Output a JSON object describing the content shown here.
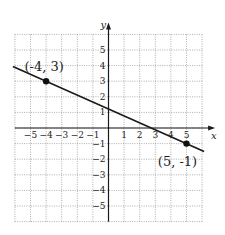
{
  "chart_data": {
    "type": "line",
    "title": "",
    "xlabel": "x",
    "ylabel": "y",
    "xlim": [
      -6,
      6
    ],
    "ylim": [
      -6,
      6
    ],
    "grid": true,
    "grid_style": "dotted",
    "x_ticks": [
      -5,
      -4,
      -3,
      -2,
      -1,
      1,
      2,
      3,
      4,
      5
    ],
    "y_ticks": [
      5,
      4,
      3,
      2,
      1,
      -1,
      -2,
      -3,
      -4,
      -5
    ],
    "x_tick_labels": [
      "−5",
      "−4",
      "−3",
      "−2",
      "−1",
      "1",
      "2",
      "3",
      "4",
      "5"
    ],
    "y_tick_labels": [
      "5",
      "4",
      "3",
      "2",
      "1",
      "−1",
      "−2",
      "−3",
      "−4",
      "−5"
    ],
    "series": [
      {
        "name": "line",
        "color": "#1a1a1a",
        "x": [
          -6,
          6
        ],
        "y": [
          3.889,
          -1.444
        ],
        "slope": -0.444,
        "intercept": 1.222
      }
    ],
    "points": [
      {
        "x": -4,
        "y": 3,
        "label": "(-4, 3)"
      },
      {
        "x": 5,
        "y": -1,
        "label": "(5, -1)"
      }
    ],
    "annotations": [
      "(-4, 3)",
      "(5, -1)"
    ],
    "legend": null
  },
  "colors": {
    "grid": "#9a9a9a",
    "axis": "#1a1a1a",
    "line": "#1a1a1a",
    "point": "#111111"
  }
}
